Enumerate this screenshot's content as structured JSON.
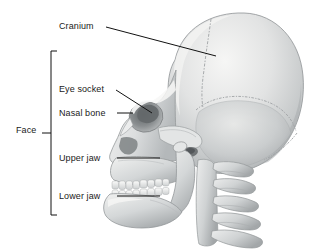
{
  "figure": {
    "background_color": "#ffffff",
    "line_color": "#111111",
    "bone_light": "#f2f2f0",
    "bone_mid": "#cccecf",
    "bone_shadow": "#9b9ea0",
    "cavity_dark": "#6f7375"
  },
  "labels": {
    "cranium": "Cranium",
    "eye_socket": "Eye socket",
    "nasal_bone": "Nasal bone",
    "upper_jaw": "Upper jaw",
    "lower_jaw": "Lower jaw",
    "face": "Face"
  },
  "anatomy": {
    "parts": [
      "cranium",
      "eye-socket",
      "nasal-bone",
      "upper-jaw",
      "lower-jaw",
      "teeth",
      "zygomatic-arch",
      "ear-canal",
      "cervical-vertebrae",
      "cranial-sutures"
    ],
    "face_group": [
      "eye socket",
      "nasal bone",
      "upper jaw",
      "lower jaw"
    ]
  }
}
